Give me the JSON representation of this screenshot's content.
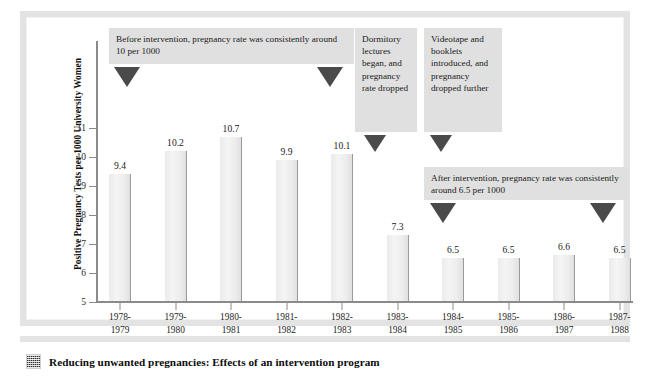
{
  "figure": {
    "caption": "Reducing unwanted pregnancies: Effects of an intervention program",
    "caption_icon": "halftone-square-icon"
  },
  "chart_data": {
    "type": "bar",
    "title": "",
    "xlabel": "Academic Year",
    "ylabel": "Positive Pregnancy Tests per 1000 University Women",
    "categories": [
      "1978-\n1979",
      "1979-\n1980",
      "1980-\n1981",
      "1981-\n1982",
      "1982-\n1983",
      "1983-\n1984",
      "1984-\n1985",
      "1985-\n1986",
      "1986-\n1987",
      "1987-\n1988"
    ],
    "category_lines": [
      [
        "1978-",
        "1979"
      ],
      [
        "1979-",
        "1980"
      ],
      [
        "1980-",
        "1981"
      ],
      [
        "1981-",
        "1982"
      ],
      [
        "1982-",
        "1983"
      ],
      [
        "1983-",
        "1984"
      ],
      [
        "1984-",
        "1985"
      ],
      [
        "1985-",
        "1986"
      ],
      [
        "1986-",
        "1987"
      ],
      [
        "1987-",
        "1988"
      ]
    ],
    "values": [
      9.4,
      10.2,
      10.7,
      9.9,
      10.1,
      7.3,
      6.5,
      6.5,
      6.6,
      6.5
    ],
    "value_labels": [
      "9.4",
      "10.2",
      "10.7",
      "9.9",
      "10.1",
      "7.3",
      "6.5",
      "6.5",
      "6.6",
      "6.5"
    ],
    "ylim": [
      5,
      11.6
    ],
    "yticks": [
      5,
      6,
      7,
      8,
      9,
      10,
      11
    ],
    "ytick_labels": [
      "5",
      "6",
      "7",
      "8",
      "9",
      "10",
      "11"
    ],
    "grid": false,
    "legend": "none",
    "bar_color": "#ededed",
    "bar_edge_color": "#9a9a9a",
    "annotations": [
      {
        "id": "before-intervention",
        "text": "Before intervention, pregnancy rate was consistently around 10 per 1000",
        "pointers": 2
      },
      {
        "id": "dormitory-lectures",
        "text": "Dormitory lectures began, and pregnancy rate dropped",
        "pointers": 1
      },
      {
        "id": "videotape-booklets",
        "text": "Videotape and booklets introduced, and pregnancy dropped further",
        "pointers": 1
      },
      {
        "id": "after-intervention",
        "text": "After intervention, pregnancy rate was consistently around 6.5 per 1000",
        "pointers": 2
      }
    ],
    "annotation_box_color": "#e0e0e0",
    "pointer_color": "#4a4a4a"
  }
}
